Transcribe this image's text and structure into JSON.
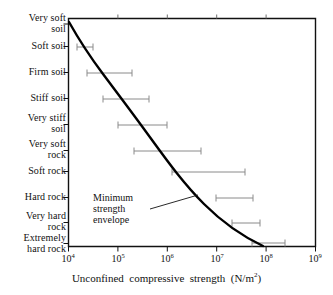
{
  "chart_data": {
    "type": "bar",
    "orientation": "horizontal",
    "title": "",
    "xlabel": "Unconfined compressive strength (N/m²)",
    "ylabel": "",
    "xscale": "log",
    "xlim": [
      10000,
      1000000000
    ],
    "grid": false,
    "legend": false,
    "xticks": [
      {
        "value": 10000,
        "label": "10",
        "exponent": "4"
      },
      {
        "value": 100000,
        "label": "10",
        "exponent": "5"
      },
      {
        "value": 1000000,
        "label": "10",
        "exponent": "6"
      },
      {
        "value": 10000000,
        "label": "10",
        "exponent": "7"
      },
      {
        "value": 100000000,
        "label": "10",
        "exponent": "8"
      },
      {
        "value": 1000000000,
        "label": "10",
        "exponent": "9"
      }
    ],
    "categories": [
      "Very soft\nsoil",
      "Soft soil",
      "Firm soil",
      "Stiff soil",
      "Very stiff\nsoil",
      "Very soft\nrock",
      "Soft rock",
      "Hard rock",
      "Very hard\nrock",
      "Extremely\nhard rock"
    ],
    "ranges": [
      {
        "category": "Very soft soil",
        "low": null,
        "high": null
      },
      {
        "category": "Soft soil",
        "low": 15000,
        "high": 33000
      },
      {
        "category": "Firm soil",
        "low": 25000,
        "high": 230000
      },
      {
        "category": "Stiff soil",
        "low": 50000,
        "high": 430000
      },
      {
        "category": "Very stiff soil",
        "low": 100000,
        "high": 1000000
      },
      {
        "category": "Very soft rock",
        "low": 220000,
        "high": 5000000
      },
      {
        "category": "Soft rock",
        "low": 1500000,
        "high": 42000000
      },
      {
        "category": "Hard rock",
        "low": 10000000,
        "high": 57000000
      },
      {
        "category": "Very hard rock",
        "low": 21000000,
        "high": 78000000
      },
      {
        "category": "Extremely hard rock",
        "low": 54000000,
        "high": 250000000
      }
    ],
    "curve": {
      "name": "Minimum strength envelope",
      "points": [
        [
          9000,
          0
        ],
        [
          15000,
          1
        ],
        [
          25000,
          2
        ],
        [
          50000,
          3
        ],
        [
          100000,
          4
        ],
        [
          220000,
          5
        ],
        [
          1500000,
          7
        ],
        [
          10000000,
          8
        ],
        [
          54000000,
          9.6
        ]
      ]
    },
    "annotations": [
      {
        "text": "Minimum\nstrength\nenvelope",
        "target": "curve"
      }
    ],
    "colors": {
      "axis": "#111111",
      "curve": "#000000",
      "range_bar": "#8a8a8a",
      "text": "#111111",
      "background": "#ffffff"
    }
  }
}
